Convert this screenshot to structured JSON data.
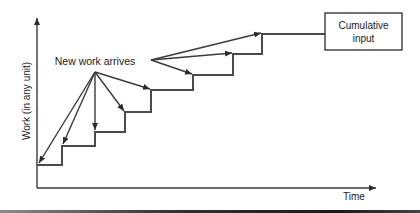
{
  "diagram": {
    "axes": {
      "y_label": "Work (in any unit)",
      "x_label": "Time"
    },
    "annotation": "New work arrives",
    "box_label_line1": "Cumulative",
    "box_label_line2": "input",
    "colors": {
      "line": "#3a3a3a",
      "step": "#4a4a4a",
      "text": "#222222",
      "background": "#ffffff"
    },
    "steps": [
      {
        "x": 37,
        "y": 165
      },
      {
        "x": 62,
        "y": 146
      },
      {
        "x": 95,
        "y": 132
      },
      {
        "x": 125,
        "y": 112
      },
      {
        "x": 151,
        "y": 90
      },
      {
        "x": 193,
        "y": 75
      },
      {
        "x": 233,
        "y": 54
      },
      {
        "x": 262,
        "y": 34
      }
    ]
  }
}
